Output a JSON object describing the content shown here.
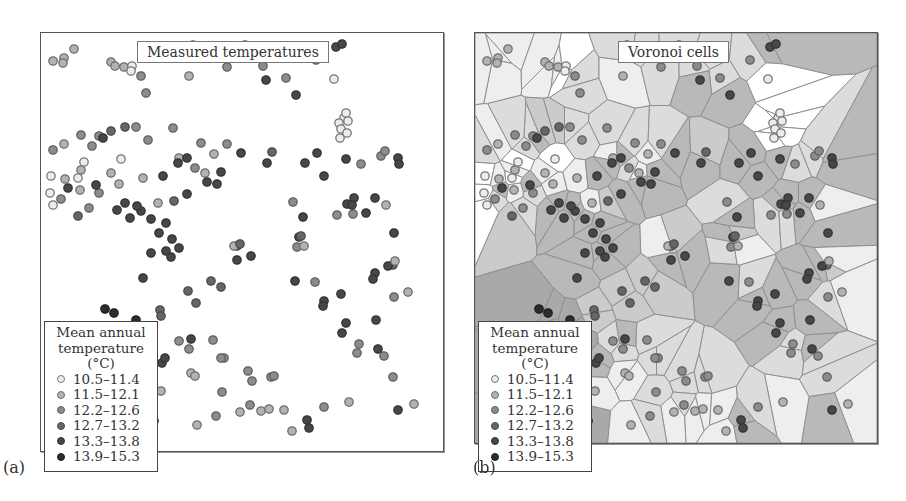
{
  "figure": {
    "panel_a": {
      "label": "(a)",
      "title": "Measured temperatures"
    },
    "panel_b": {
      "label": "(b)",
      "title": "Voronoi cells"
    }
  },
  "legend": {
    "title_line1": "Mean annual",
    "title_line2": "temperature (°C)",
    "classes": [
      {
        "label": "10.5–11.4",
        "fill": "#ececec",
        "stroke": "#777777",
        "cell": "#ffffff"
      },
      {
        "label": "11.5–12.1",
        "fill": "#b2b2b2",
        "stroke": "#6e6e6e",
        "cell": "#eeeeee"
      },
      {
        "label": "12.2–12.6",
        "fill": "#8c8c8c",
        "stroke": "#5e5e5e",
        "cell": "#dcdcdc"
      },
      {
        "label": "12.7–13.2",
        "fill": "#666666",
        "stroke": "#4a4a4a",
        "cell": "#cbcbcb"
      },
      {
        "label": "13.3–13.8",
        "fill": "#474747",
        "stroke": "#333333",
        "cell": "#b9b9b9"
      },
      {
        "label": "13.9–15.3",
        "fill": "#2c2c2c",
        "stroke": "#1e1e1e",
        "cell": "#a9a9a9"
      }
    ]
  },
  "chart_data": {
    "type": "scatter",
    "xlabel": "",
    "ylabel": "",
    "legend_position": "lower-left",
    "grid": false,
    "note": "Points in panel-relative pixel coordinates (0-400 x, 0-410 y); class = legend class index 0-5",
    "points": [
      [
        33,
        16,
        1
      ],
      [
        23,
        25,
        1
      ],
      [
        22,
        30,
        1
      ],
      [
        12,
        28,
        1
      ],
      [
        70,
        29,
        1
      ],
      [
        74,
        33,
        1
      ],
      [
        83,
        34,
        1
      ],
      [
        91,
        33,
        0
      ],
      [
        90,
        38,
        0
      ],
      [
        100,
        43,
        2
      ],
      [
        105,
        60,
        2
      ],
      [
        148,
        43,
        1
      ],
      [
        186,
        34,
        2
      ],
      [
        222,
        33,
        2
      ],
      [
        152,
        12,
        2
      ],
      [
        165,
        14,
        2
      ],
      [
        204,
        12,
        2
      ],
      [
        234,
        23,
        2
      ],
      [
        275,
        27,
        2
      ],
      [
        295,
        14,
        4
      ],
      [
        301,
        11,
        4
      ],
      [
        293,
        46,
        0
      ],
      [
        245,
        45,
        2
      ],
      [
        225,
        47,
        4
      ],
      [
        255,
        62,
        4
      ],
      [
        303,
        85,
        0
      ],
      [
        305,
        80,
        0
      ],
      [
        298,
        90,
        0
      ],
      [
        300,
        96,
        0
      ],
      [
        307,
        88,
        0
      ],
      [
        299,
        105,
        0
      ],
      [
        306,
        100,
        0
      ],
      [
        84,
        94,
        3
      ],
      [
        58,
        103,
        2
      ],
      [
        51,
        113,
        2
      ],
      [
        62,
        105,
        4
      ],
      [
        70,
        98,
        3
      ],
      [
        95,
        94,
        2
      ],
      [
        40,
        102,
        2
      ],
      [
        12,
        117,
        2
      ],
      [
        23,
        111,
        1
      ],
      [
        132,
        95,
        2
      ],
      [
        107,
        107,
        2
      ],
      [
        160,
        110,
        2
      ],
      [
        173,
        121,
        1
      ],
      [
        138,
        125,
        1
      ],
      [
        164,
        140,
        1
      ],
      [
        80,
        126,
        0
      ],
      [
        70,
        140,
        1
      ],
      [
        78,
        151,
        1
      ],
      [
        102,
        145,
        1
      ],
      [
        122,
        143,
        4
      ],
      [
        146,
        125,
        4
      ],
      [
        186,
        111,
        2
      ],
      [
        200,
        120,
        4
      ],
      [
        231,
        119,
        3
      ],
      [
        226,
        130,
        4
      ],
      [
        264,
        130,
        4
      ],
      [
        276,
        120,
        4
      ],
      [
        305,
        126,
        4
      ],
      [
        320,
        131,
        2
      ],
      [
        340,
        123,
        2
      ],
      [
        344,
        118,
        2
      ],
      [
        357,
        125,
        4
      ],
      [
        358,
        131,
        4
      ],
      [
        334,
        165,
        4
      ],
      [
        345,
        172,
        1
      ],
      [
        306,
        171,
        4
      ],
      [
        313,
        165,
        4
      ],
      [
        296,
        182,
        2
      ],
      [
        262,
        184,
        4
      ],
      [
        252,
        169,
        2
      ],
      [
        258,
        204,
        4
      ],
      [
        260,
        203,
        3
      ],
      [
        196,
        213,
        3
      ],
      [
        210,
        223,
        4
      ],
      [
        254,
        248,
        4
      ],
      [
        325,
        180,
        4
      ],
      [
        353,
        200,
        4
      ],
      [
        352,
        232,
        3
      ],
      [
        256,
        214,
        2
      ],
      [
        263,
        213,
        1
      ],
      [
        312,
        181,
        2
      ],
      [
        283,
        143,
        4
      ],
      [
        311,
        172,
        4
      ],
      [
        311,
        172,
        4
      ],
      [
        334,
        240,
        4
      ],
      [
        332,
        246,
        4
      ],
      [
        347,
        233,
        4
      ],
      [
        354,
        228,
        1
      ],
      [
        367,
        259,
        1
      ],
      [
        300,
        261,
        4
      ],
      [
        274,
        249,
        2
      ],
      [
        283,
        268,
        4
      ],
      [
        282,
        273,
        4
      ],
      [
        353,
        264,
        2
      ],
      [
        305,
        290,
        4
      ],
      [
        301,
        300,
        4
      ],
      [
        318,
        311,
        2
      ],
      [
        316,
        320,
        2
      ],
      [
        337,
        316,
        4
      ],
      [
        335,
        287,
        4
      ],
      [
        352,
        344,
        2
      ],
      [
        343,
        323,
        2
      ],
      [
        373,
        371,
        1
      ],
      [
        357,
        377,
        4
      ],
      [
        308,
        369,
        1
      ],
      [
        283,
        374,
        2
      ],
      [
        243,
        377,
        1
      ],
      [
        230,
        344,
        2
      ],
      [
        233,
        343,
        2
      ],
      [
        207,
        338,
        2
      ],
      [
        211,
        348,
        2
      ],
      [
        183,
        325,
        2
      ],
      [
        180,
        325,
        2
      ],
      [
        172,
        307,
        2
      ],
      [
        148,
        316,
        2
      ],
      [
        150,
        306,
        4
      ],
      [
        121,
        330,
        4
      ],
      [
        124,
        325,
        4
      ],
      [
        138,
        308,
        2
      ],
      [
        155,
        270,
        3
      ],
      [
        180,
        254,
        3
      ],
      [
        170,
        248,
        3
      ],
      [
        196,
        227,
        4
      ],
      [
        193,
        213,
        1
      ],
      [
        199,
        211,
        3
      ],
      [
        138,
        215,
        4
      ],
      [
        131,
        206,
        4
      ],
      [
        125,
        190,
        4
      ],
      [
        118,
        200,
        4
      ],
      [
        110,
        220,
        4
      ],
      [
        100,
        178,
        4
      ],
      [
        96,
        173,
        4
      ],
      [
        84,
        170,
        4
      ],
      [
        89,
        185,
        4
      ],
      [
        110,
        186,
        4
      ],
      [
        117,
        170,
        1
      ],
      [
        133,
        168,
        3
      ],
      [
        146,
        161,
        4
      ],
      [
        166,
        149,
        4
      ],
      [
        176,
        151,
        4
      ],
      [
        180,
        139,
        4
      ],
      [
        137,
        130,
        4
      ],
      [
        154,
        135,
        2
      ],
      [
        58,
        160,
        2
      ],
      [
        55,
        152,
        4
      ],
      [
        76,
        177,
        4
      ],
      [
        48,
        175,
        2
      ],
      [
        27,
        155,
        4
      ],
      [
        20,
        166,
        2
      ],
      [
        39,
        157,
        1
      ],
      [
        37,
        183,
        3
      ],
      [
        12,
        172,
        0
      ],
      [
        9,
        160,
        0
      ],
      [
        10,
        143,
        0
      ],
      [
        24,
        146,
        1
      ],
      [
        40,
        137,
        1
      ],
      [
        37,
        145,
        0
      ],
      [
        43,
        129,
        0
      ],
      [
        102,
        245,
        4
      ],
      [
        130,
        224,
        4
      ],
      [
        125,
        218,
        4
      ],
      [
        147,
        258,
        3
      ],
      [
        119,
        277,
        3
      ],
      [
        120,
        283,
        3
      ],
      [
        97,
        298,
        5
      ],
      [
        95,
        287,
        5
      ],
      [
        100,
        294,
        5
      ],
      [
        108,
        310,
        5
      ],
      [
        99,
        318,
        5
      ],
      [
        73,
        280,
        5
      ],
      [
        66,
        300,
        5
      ],
      [
        64,
        276,
        5
      ],
      [
        77,
        295,
        5
      ],
      [
        78,
        307,
        5
      ],
      [
        90,
        300,
        5
      ],
      [
        95,
        327,
        5
      ],
      [
        64,
        330,
        5
      ],
      [
        58,
        338,
        5
      ],
      [
        70,
        310,
        5
      ],
      [
        49,
        357,
        5
      ],
      [
        46,
        343,
        5
      ],
      [
        56,
        341,
        5
      ],
      [
        96,
        386,
        5
      ],
      [
        104,
        383,
        5
      ],
      [
        113,
        388,
        5
      ],
      [
        181,
        359,
        2
      ],
      [
        209,
        372,
        2
      ],
      [
        199,
        379,
        1
      ],
      [
        175,
        383,
        2
      ],
      [
        220,
        378,
        1
      ],
      [
        228,
        376,
        1
      ],
      [
        251,
        398,
        1
      ],
      [
        266,
        387,
        4
      ],
      [
        268,
        395,
        4
      ],
      [
        156,
        392,
        1
      ],
      [
        150,
        340,
        1
      ],
      [
        154,
        343,
        1
      ],
      [
        120,
        358,
        1
      ]
    ]
  }
}
